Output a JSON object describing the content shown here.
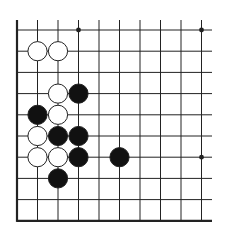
{
  "board": {
    "type": "go-diagram",
    "colors": {
      "background": "#ffffff",
      "line": "#222222",
      "black_stone": "#111111",
      "white_stone": "#ffffff",
      "stone_outline": "#222222"
    },
    "grid": {
      "cols": 10,
      "rows": 10,
      "x0": 17,
      "dx": 20.5,
      "y0": 30,
      "dy": 21.2,
      "extend_right_to": 212,
      "extend_top_to": 20,
      "thick_left_edge": true,
      "thick_bottom_edge": true
    },
    "stone_radius": 9.6,
    "hoshi": [
      {
        "col": 3,
        "row": 0
      },
      {
        "col": 9,
        "row": 0
      },
      {
        "col": 9,
        "row": 6
      }
    ],
    "stones": [
      {
        "col": 1,
        "row": 1,
        "color": "white"
      },
      {
        "col": 2,
        "row": 1,
        "color": "white"
      },
      {
        "col": 2,
        "row": 3,
        "color": "white"
      },
      {
        "col": 3,
        "row": 3,
        "color": "black"
      },
      {
        "col": 1,
        "row": 4,
        "color": "black"
      },
      {
        "col": 2,
        "row": 4,
        "color": "white"
      },
      {
        "col": 1,
        "row": 5,
        "color": "white"
      },
      {
        "col": 2,
        "row": 5,
        "color": "black"
      },
      {
        "col": 3,
        "row": 5,
        "color": "black"
      },
      {
        "col": 1,
        "row": 6,
        "color": "white"
      },
      {
        "col": 2,
        "row": 6,
        "color": "white"
      },
      {
        "col": 3,
        "row": 6,
        "color": "black"
      },
      {
        "col": 5,
        "row": 6,
        "color": "black"
      },
      {
        "col": 2,
        "row": 7,
        "color": "black"
      }
    ]
  }
}
